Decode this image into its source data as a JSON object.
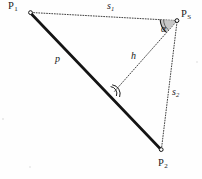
{
  "figure": {
    "type": "geometry-diagram",
    "background_color": "#fefefe",
    "line_color": "#1a1a1a",
    "wedge_fill_color": "#b9b9b9",
    "points": [
      {
        "id": "P1",
        "label": "P",
        "subscript": "1",
        "x": 30,
        "y": 12,
        "label_x": 8,
        "label_y": 2
      },
      {
        "id": "PS",
        "label": "P",
        "subscript": "S",
        "x": 177,
        "y": 20,
        "label_x": 181,
        "label_y": 10
      },
      {
        "id": "P2",
        "label": "P",
        "subscript": "2",
        "x": 161,
        "y": 150,
        "label_x": 159,
        "label_y": 160
      }
    ],
    "foot": {
      "id": "F",
      "x": 113,
      "y": 93
    },
    "segments": [
      {
        "id": "p",
        "label": "p",
        "subscript": "",
        "from": "P1",
        "to": "P2",
        "style": "thick-solid",
        "width": 2.6,
        "label_x": 55,
        "label_y": 55
      },
      {
        "id": "s1",
        "label": "s",
        "subscript": "1",
        "from": "P1",
        "to": "PS",
        "style": "dotted",
        "width": 0.9,
        "label_x": 107,
        "label_y": 1
      },
      {
        "id": "s2",
        "label": "s",
        "subscript": "2",
        "from": "PS",
        "to": "P2",
        "style": "dotted",
        "width": 0.9,
        "label_x": 172,
        "label_y": 88
      },
      {
        "id": "h",
        "label": "h",
        "subscript": "",
        "from": "PS",
        "to": "F",
        "style": "dotted",
        "width": 0.9,
        "label_x": 131,
        "label_y": 52
      }
    ],
    "angles": [
      {
        "id": "alpha",
        "label": "α",
        "at": "PS",
        "between": [
          "s1",
          "h"
        ],
        "marker": "filled-wedge-arc",
        "label_x": 161,
        "label_y": 26
      },
      {
        "id": "right-angle",
        "label": "",
        "at": "F",
        "between": [
          "h",
          "p"
        ],
        "marker": "double-arc",
        "label_x": 0,
        "label_y": 0
      }
    ]
  }
}
